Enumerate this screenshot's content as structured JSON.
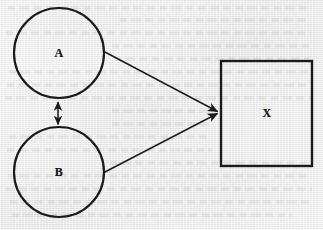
{
  "figure": {
    "background_color": "#eaeaea",
    "stroke_color": "#1b1b1b",
    "width": 323,
    "height": 230,
    "nodes": [
      {
        "id": "A",
        "label": "A",
        "shape": "circle",
        "cx": 59,
        "cy": 53,
        "r": 45,
        "stroke_width": 2.2,
        "fill": "none"
      },
      {
        "id": "B",
        "label": "B",
        "shape": "circle",
        "cx": 59,
        "cy": 172,
        "r": 45,
        "stroke_width": 2.2,
        "fill": "none"
      },
      {
        "id": "X",
        "label": "X",
        "shape": "rectangle",
        "x": 221,
        "y": 61,
        "width": 91,
        "height": 105,
        "cx": 267,
        "cy": 113,
        "stroke_width": 2.4,
        "fill": "none"
      }
    ],
    "edges": [
      {
        "id": "a-to-x",
        "from": "A",
        "to": "X",
        "arrowheads": "end",
        "direction": "one-way",
        "x1": 103,
        "y1": 51,
        "x2": 220,
        "y2": 112,
        "stroke_width": 1.5
      },
      {
        "id": "b-to-x",
        "from": "B",
        "to": "X",
        "arrowheads": "end",
        "direction": "one-way",
        "x1": 103,
        "y1": 173,
        "x2": 220,
        "y2": 113,
        "stroke_width": 1.5
      },
      {
        "id": "a-b-correlation",
        "from": "A",
        "to": "B",
        "arrowheads": "both",
        "direction": "two-way",
        "x1": 58,
        "y1": 99,
        "x2": 58,
        "y2": 127,
        "stroke_width": 1.5
      }
    ],
    "bleed_lines": [
      {
        "left": 8,
        "top": 6,
        "width": 300
      },
      {
        "left": 120,
        "top": 18,
        "width": 190
      },
      {
        "left": 6,
        "top": 31,
        "width": 305
      },
      {
        "left": 112,
        "top": 44,
        "width": 200
      },
      {
        "left": 114,
        "top": 57,
        "width": 196
      },
      {
        "left": 9,
        "top": 70,
        "width": 301
      },
      {
        "left": 7,
        "top": 83,
        "width": 304
      },
      {
        "left": 5,
        "top": 96,
        "width": 306
      },
      {
        "left": 112,
        "top": 109,
        "width": 100
      },
      {
        "left": 112,
        "top": 122,
        "width": 102
      },
      {
        "left": 9,
        "top": 135,
        "width": 201
      },
      {
        "left": 7,
        "top": 148,
        "width": 205
      },
      {
        "left": 110,
        "top": 161,
        "width": 201
      },
      {
        "left": 8,
        "top": 174,
        "width": 304
      },
      {
        "left": 6,
        "top": 187,
        "width": 306
      },
      {
        "left": 10,
        "top": 200,
        "width": 299
      },
      {
        "left": 12,
        "top": 213,
        "width": 280
      }
    ]
  }
}
